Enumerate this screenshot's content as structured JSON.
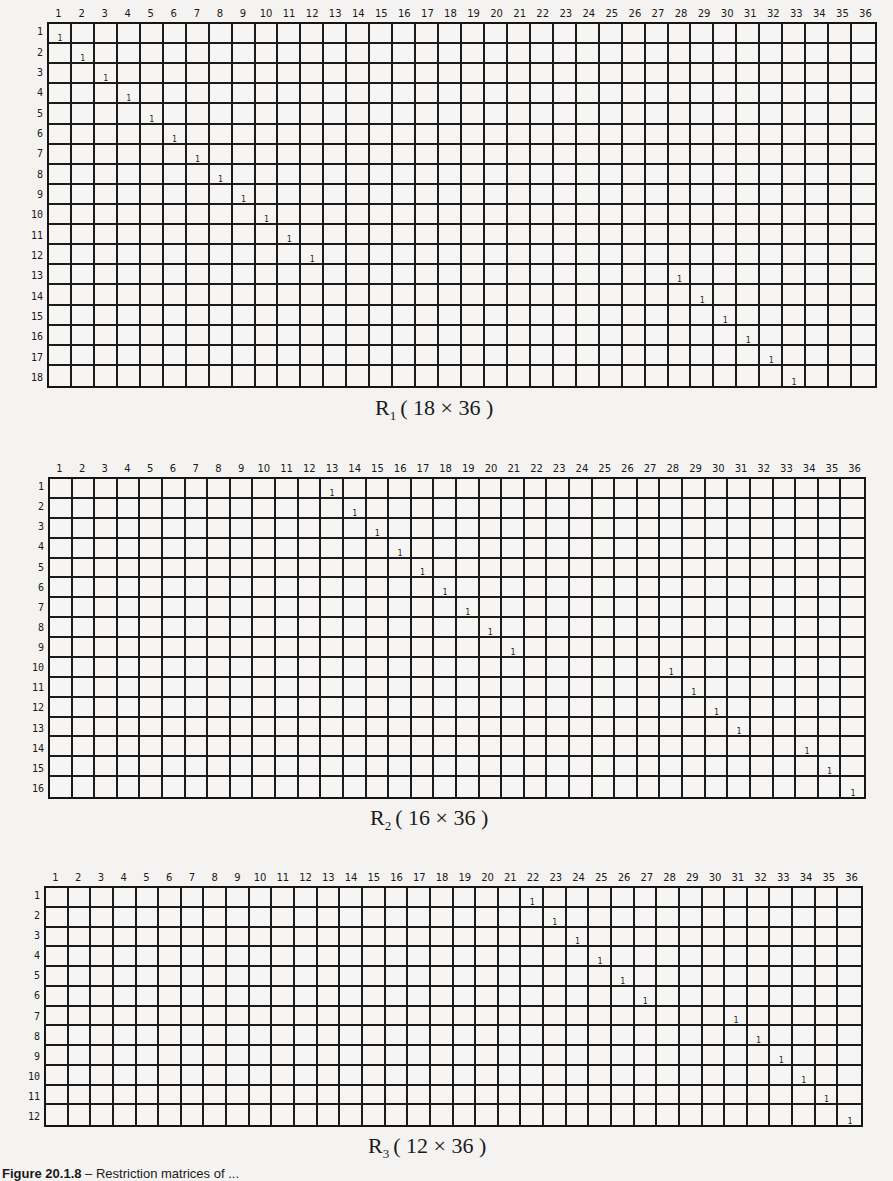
{
  "matrices": [
    {
      "id": "R1",
      "name": "R",
      "subscript": "1",
      "dims": "( 18 × 36 )",
      "rows": 18,
      "cols": 36,
      "ones": [
        [
          1,
          1
        ],
        [
          2,
          2
        ],
        [
          3,
          3
        ],
        [
          4,
          4
        ],
        [
          5,
          5
        ],
        [
          6,
          6
        ],
        [
          7,
          7
        ],
        [
          8,
          8
        ],
        [
          9,
          9
        ],
        [
          10,
          10
        ],
        [
          11,
          11
        ],
        [
          12,
          12
        ],
        [
          13,
          28
        ],
        [
          14,
          29
        ],
        [
          15,
          30
        ],
        [
          16,
          31
        ],
        [
          17,
          32
        ],
        [
          18,
          33
        ]
      ],
      "layout": {
        "left": 47,
        "top": 22,
        "width": 830,
        "height": 366,
        "caption_left": 375,
        "caption_top": 395
      }
    },
    {
      "id": "R2",
      "name": "R",
      "subscript": "2",
      "dims": "( 16 × 36 )",
      "rows": 16,
      "cols": 36,
      "ones": [
        [
          1,
          13
        ],
        [
          2,
          14
        ],
        [
          3,
          15
        ],
        [
          4,
          16
        ],
        [
          5,
          17
        ],
        [
          6,
          18
        ],
        [
          7,
          19
        ],
        [
          8,
          20
        ],
        [
          9,
          21
        ],
        [
          10,
          28
        ],
        [
          11,
          29
        ],
        [
          12,
          30
        ],
        [
          13,
          31
        ],
        [
          14,
          34
        ],
        [
          15,
          35
        ],
        [
          16,
          36
        ]
      ],
      "layout": {
        "left": 48,
        "top": 477,
        "width": 818,
        "height": 322,
        "caption_left": 370,
        "caption_top": 805
      }
    },
    {
      "id": "R3",
      "name": "R",
      "subscript": "3",
      "dims": "( 12 × 36 )",
      "rows": 12,
      "cols": 36,
      "ones": [
        [
          1,
          22
        ],
        [
          2,
          23
        ],
        [
          3,
          24
        ],
        [
          4,
          25
        ],
        [
          5,
          26
        ],
        [
          6,
          27
        ],
        [
          7,
          31
        ],
        [
          8,
          32
        ],
        [
          9,
          33
        ],
        [
          10,
          34
        ],
        [
          11,
          35
        ],
        [
          12,
          36
        ]
      ],
      "layout": {
        "left": 44,
        "top": 886,
        "width": 819,
        "height": 241,
        "caption_left": 368,
        "caption_top": 1133
      }
    }
  ],
  "figure_caption": {
    "label": "Figure 20.1.8",
    "text": "– Restriction matrices of ..."
  }
}
